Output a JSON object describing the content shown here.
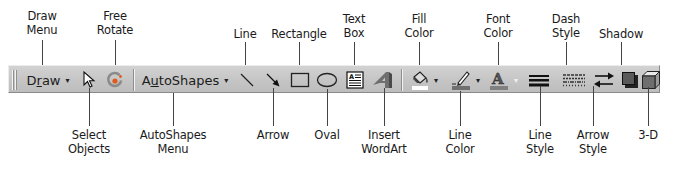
{
  "toolbar": {
    "draw_menu": {
      "prefix": "D",
      "accel": "r",
      "suffix": "aw"
    },
    "autoshapes_menu": {
      "prefix": "A",
      "accel": "u",
      "suffix": "toShapes"
    },
    "dropdown_glyph": "▾",
    "icons": [
      "select-objects-icon",
      "free-rotate-icon",
      "line-icon",
      "arrow-icon",
      "rectangle-icon",
      "oval-icon",
      "text-box-icon",
      "insert-wordart-icon",
      "fill-color-icon",
      "line-color-icon",
      "font-color-icon",
      "line-style-icon",
      "dash-style-icon",
      "arrow-style-icon",
      "shadow-icon",
      "3d-icon"
    ],
    "colors": {
      "background": "#c6c6c6",
      "fill_swatch": "#ffffff",
      "line_swatch": "#707070",
      "font_swatch": "#808080"
    }
  },
  "callouts": {
    "top": [
      {
        "line1": "Draw",
        "line2": "Menu"
      },
      {
        "line1": "Free",
        "line2": "Rotate"
      },
      {
        "line1": "Line",
        "line2": ""
      },
      {
        "line1": "Rectangle",
        "line2": ""
      },
      {
        "line1": "Text",
        "line2": "Box"
      },
      {
        "line1": "Fill",
        "line2": "Color"
      },
      {
        "line1": "Font",
        "line2": "Color"
      },
      {
        "line1": "Dash",
        "line2": "Style"
      },
      {
        "line1": "Shadow",
        "line2": ""
      }
    ],
    "bottom": [
      {
        "line1": "Select",
        "line2": "Objects"
      },
      {
        "line1": "AutoShapes",
        "line2": "Menu"
      },
      {
        "line1": "Arrow",
        "line2": ""
      },
      {
        "line1": "Oval",
        "line2": ""
      },
      {
        "line1": "Insert",
        "line2": "WordArt"
      },
      {
        "line1": "Line",
        "line2": "Color"
      },
      {
        "line1": "Line",
        "line2": "Style"
      },
      {
        "line1": "Arrow",
        "line2": "Style"
      },
      {
        "line1": "3-D",
        "line2": ""
      }
    ]
  }
}
